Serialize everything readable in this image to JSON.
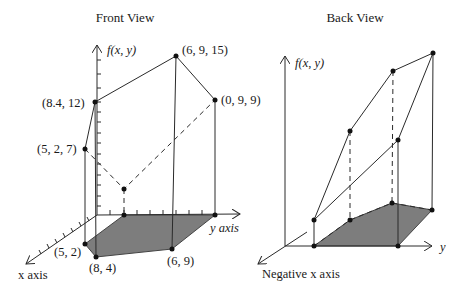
{
  "front_view": {
    "title": "Front View",
    "z_axis_label": "f(x, y)",
    "y_axis_label": "y axis",
    "x_axis_label": "x axis",
    "top_points": [
      {
        "label": "(6, 9, 15)"
      },
      {
        "label": "(8.4, 12)"
      },
      {
        "label": "(0, 9, 9)"
      },
      {
        "label": "(5, 2, 7)"
      }
    ],
    "base_points": [
      {
        "label": "(5, 2)"
      },
      {
        "label": "(8, 4)"
      },
      {
        "label": "(6, 9)"
      }
    ]
  },
  "back_view": {
    "title": "Back View",
    "z_axis_label": "f(x, y)",
    "y_axis_label": "y",
    "x_axis_label": "Negative x axis"
  },
  "colors": {
    "base_plane": "#7d7d7d",
    "lines": "#2a2a2a",
    "background": "#ffffff"
  }
}
